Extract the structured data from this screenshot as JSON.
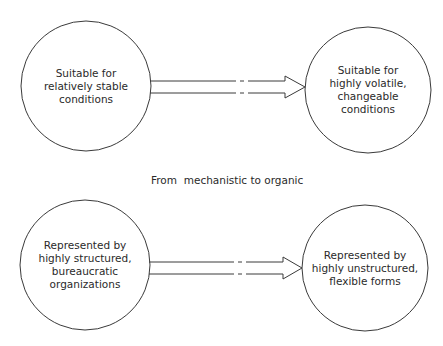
{
  "diagram": {
    "caption": "From  mechanistic to organic",
    "rows": [
      {
        "from": {
          "lines": [
            "Suitable for",
            "relatively stable",
            "conditions"
          ]
        },
        "to": {
          "lines": [
            "Suitable for",
            "highly volatile,",
            "changeable",
            "conditions"
          ]
        }
      },
      {
        "from": {
          "lines": [
            "Represented by",
            "highly structured,",
            "bureaucratic",
            "organizations"
          ]
        },
        "to": {
          "lines": [
            "Represented by",
            "highly unstructured,",
            "flexible forms"
          ]
        }
      }
    ],
    "colors": {
      "stroke": "#3a3a3a",
      "text": "#2a2a2a",
      "background": "#ffffff"
    }
  }
}
